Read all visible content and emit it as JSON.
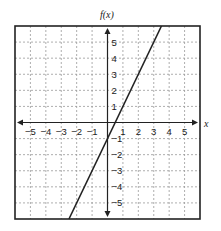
{
  "chart_data": {
    "type": "line",
    "title": "",
    "xlabel": "x",
    "ylabel": "f(x)",
    "xlim": [
      -6,
      6
    ],
    "ylim": [
      -6,
      6
    ],
    "grid": true,
    "x_ticks": [
      "-5",
      "-4",
      "-3",
      "-2",
      "-1",
      "1",
      "2",
      "3",
      "4",
      "5"
    ],
    "y_ticks": [
      "5",
      "4",
      "3",
      "2",
      "1",
      "-1",
      "-2",
      "-3",
      "-4",
      "-5"
    ],
    "series": [
      {
        "name": "f(x) = 2x - 1",
        "slope": 2,
        "intercept": -1,
        "x": [
          -2.5,
          0,
          0.5,
          3.5
        ],
        "y": [
          -6,
          -1,
          0,
          6
        ]
      }
    ],
    "colors": {
      "line": "#222222",
      "grid": "#999999",
      "frame": "#222222"
    }
  }
}
